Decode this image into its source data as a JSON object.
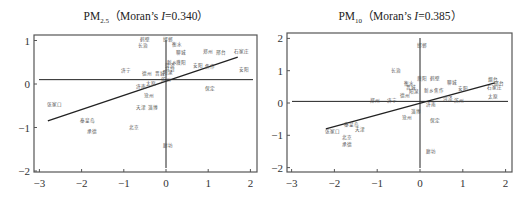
{
  "chart_data": [
    {
      "type": "scatter",
      "title": "PM2.5（Moran's I=0.340）",
      "title_parts": {
        "main": "PM",
        "sub": "2.5",
        "rest": "（Moran’s ",
        "italic": "I",
        "value": "=0.340）"
      },
      "morans_i": 0.34,
      "xlabel": "",
      "ylabel": "",
      "xlim": [
        -3,
        2
      ],
      "ylim": [
        -2,
        1
      ],
      "xticks": [
        -3,
        -2,
        -1,
        0,
        1,
        2
      ],
      "yticks": [
        -2,
        -1,
        0,
        1
      ],
      "grid": false,
      "reference_lines": {
        "horizontal_y": 0.1,
        "vertical_x": 0
      },
      "regression_line": {
        "x0": -2.8,
        "y0": -0.85,
        "x1": 1.7,
        "y1": 0.62
      },
      "points": [
        {
          "label": "鹤壁",
          "x": -0.5,
          "y": 0.98
        },
        {
          "label": "邯郸",
          "x": 0.05,
          "y": 0.98
        },
        {
          "label": "长治",
          "x": -0.55,
          "y": 0.85
        },
        {
          "label": "衡水",
          "x": 0.25,
          "y": 0.88
        },
        {
          "label": "郑州",
          "x": 1.0,
          "y": 0.71
        },
        {
          "label": "邢台",
          "x": 1.3,
          "y": 0.7
        },
        {
          "label": "石家庄",
          "x": 1.8,
          "y": 0.72
        },
        {
          "label": "聊城",
          "x": 0.35,
          "y": 0.68
        },
        {
          "label": "新乡",
          "x": 0.15,
          "y": 0.47
        },
        {
          "label": "濮阳",
          "x": 0.35,
          "y": 0.47
        },
        {
          "label": "菏泽",
          "x": 0.1,
          "y": 0.38
        },
        {
          "label": "安阳",
          "x": 0.75,
          "y": 0.38
        },
        {
          "label": "焦作",
          "x": 1.05,
          "y": 0.36
        },
        {
          "label": "开封",
          "x": 0.1,
          "y": 0.3
        },
        {
          "label": "济宁",
          "x": -0.95,
          "y": 0.28
        },
        {
          "label": "德州",
          "x": -0.45,
          "y": 0.2
        },
        {
          "label": "晋城",
          "x": -0.15,
          "y": 0.21
        },
        {
          "label": "阳泉",
          "x": 0.05,
          "y": 0.22
        },
        {
          "label": "安阳2",
          "x": 1.85,
          "y": 0.3,
          "display": "安阳"
        },
        {
          "label": "滨州",
          "x": 0.0,
          "y": 0.08
        },
        {
          "label": "太原",
          "x": -0.35,
          "y": -0.03
        },
        {
          "label": "济南",
          "x": -0.6,
          "y": -0.1
        },
        {
          "label": "保定",
          "x": 1.05,
          "y": -0.14
        },
        {
          "label": "沧州",
          "x": -0.4,
          "y": -0.3
        },
        {
          "label": "张家口",
          "x": -2.65,
          "y": -0.5
        },
        {
          "label": "天津",
          "x": -0.6,
          "y": -0.58
        },
        {
          "label": "淄博",
          "x": -0.3,
          "y": -0.58
        },
        {
          "label": "秦皇岛",
          "x": -1.85,
          "y": -0.88
        },
        {
          "label": "北京",
          "x": -0.75,
          "y": -1.03
        },
        {
          "label": "承德",
          "x": -1.75,
          "y": -1.12
        },
        {
          "label": "廊坊",
          "x": 0.05,
          "y": -1.45
        }
      ]
    },
    {
      "type": "scatter",
      "title": "PM10（Moran's I=0.385）",
      "title_parts": {
        "main": "PM",
        "sub": "10",
        "rest": "（Moran’s ",
        "italic": "I",
        "value": "=0.385）"
      },
      "morans_i": 0.385,
      "xlabel": "",
      "ylabel": "",
      "xlim": [
        -3,
        2
      ],
      "ylim": [
        -2,
        2
      ],
      "xticks": [
        -3,
        -2,
        -1,
        0,
        1,
        2
      ],
      "yticks": [
        -2,
        -1,
        0,
        1,
        2
      ],
      "grid": false,
      "reference_lines": {
        "horizontal_y": 0.05,
        "vertical_x": 0
      },
      "regression_line": {
        "x0": -2.2,
        "y0": -0.8,
        "x1": 1.75,
        "y1": 0.62
      },
      "points": [
        {
          "label": "邯郸",
          "x": 0.05,
          "y": 1.72
        },
        {
          "label": "长治",
          "x": -0.55,
          "y": 0.97
        },
        {
          "label": "濮阳",
          "x": 0.05,
          "y": 0.72
        },
        {
          "label": "鹤壁",
          "x": 0.35,
          "y": 0.7
        },
        {
          "label": "衡水",
          "x": -0.25,
          "y": 0.55
        },
        {
          "label": "聊城",
          "x": 0.75,
          "y": 0.58
        },
        {
          "label": "烟台",
          "x": 1.7,
          "y": 0.68
        },
        {
          "label": "邢台",
          "x": 1.85,
          "y": 0.55
        },
        {
          "label": "石家庄",
          "x": 1.75,
          "y": 0.42
        },
        {
          "label": "晋城",
          "x": -0.2,
          "y": 0.42
        },
        {
          "label": "新乡",
          "x": 0.2,
          "y": 0.35
        },
        {
          "label": "焦作",
          "x": 0.45,
          "y": 0.33
        },
        {
          "label": "安阳",
          "x": 1.0,
          "y": 0.4
        },
        {
          "label": "德州",
          "x": -0.35,
          "y": 0.18
        },
        {
          "label": "阳泉",
          "x": -0.15,
          "y": 0.32
        },
        {
          "label": "菏泽",
          "x": 0.65,
          "y": 0.1
        },
        {
          "label": "滨州",
          "x": 0.9,
          "y": 0.04
        },
        {
          "label": "太原",
          "x": 1.7,
          "y": 0.14
        },
        {
          "label": "郑州",
          "x": -1.05,
          "y": 0.02
        },
        {
          "label": "济宁",
          "x": -0.65,
          "y": 0.04
        },
        {
          "label": "济南",
          "x": 0.25,
          "y": -0.08
        },
        {
          "label": "淄博",
          "x": -0.1,
          "y": -0.3
        },
        {
          "label": "沧州",
          "x": -0.3,
          "y": -0.5
        },
        {
          "label": "保定",
          "x": 0.35,
          "y": -0.6
        },
        {
          "label": "秦皇岛",
          "x": -1.6,
          "y": -0.7
        },
        {
          "label": "天津",
          "x": -1.4,
          "y": -0.88
        },
        {
          "label": "张家口",
          "x": -2.05,
          "y": -0.92
        },
        {
          "label": "北京",
          "x": -1.7,
          "y": -1.12
        },
        {
          "label": "承德",
          "x": -1.7,
          "y": -1.32
        },
        {
          "label": "廊坊",
          "x": 0.25,
          "y": -1.55
        }
      ]
    }
  ],
  "style": {
    "axis_color": "#555555",
    "line_color": "#222222",
    "label_color": "#555555",
    "background": "#ffffff"
  }
}
